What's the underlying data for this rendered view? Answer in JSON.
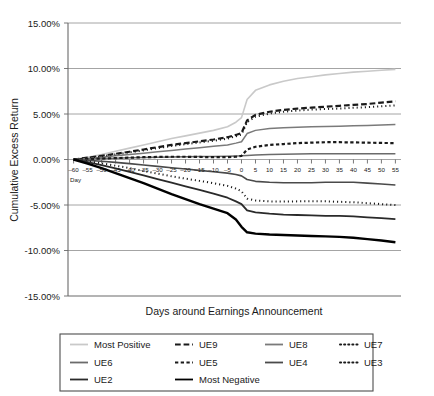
{
  "chart_data": {
    "type": "line",
    "title": "",
    "xlabel": "Days around Earnings Announcement",
    "ylabel": "Cumulative Excess Return",
    "xlim": [
      -62,
      57
    ],
    "ylim": [
      -15,
      15
    ],
    "grid": true,
    "legend_position": "bottom",
    "x_axis_prefix_label": "Day",
    "y_tick_labels": [
      "15.00%",
      "10.00%",
      "5.00%",
      "0.00%",
      "-5.00%",
      "-10.00%",
      "-15.00%"
    ],
    "y_tick_values": [
      15,
      10,
      5,
      0,
      -5,
      -10,
      -15
    ],
    "x_tick_labels": [
      "-60",
      "-55",
      "-50",
      "-45",
      "-40",
      "-35",
      "-30",
      "-25",
      "-20",
      "-15",
      "-10",
      "-5",
      "0",
      "5",
      "10",
      "15",
      "20",
      "25",
      "30",
      "35",
      "40",
      "45",
      "50",
      "55"
    ],
    "x": [
      -60,
      -55,
      -50,
      -45,
      -40,
      -35,
      -30,
      -25,
      -20,
      -15,
      -10,
      -5,
      -2,
      0,
      2,
      5,
      10,
      15,
      20,
      25,
      30,
      35,
      40,
      45,
      50,
      55
    ],
    "series": [
      {
        "name": "Most Positive",
        "style": "solid",
        "color": "#c9c9c9",
        "width": 1.6,
        "values": [
          0.0,
          0.25,
          0.55,
          0.9,
          1.25,
          1.6,
          1.95,
          2.3,
          2.6,
          2.9,
          3.2,
          3.6,
          4.1,
          4.6,
          6.6,
          7.6,
          8.2,
          8.6,
          8.9,
          9.1,
          9.3,
          9.45,
          9.6,
          9.7,
          9.8,
          9.9
        ]
      },
      {
        "name": "UE9",
        "style": "dashed",
        "color": "#1a1a1a",
        "width": 2.2,
        "values": [
          0.0,
          0.2,
          0.4,
          0.62,
          0.85,
          1.1,
          1.35,
          1.6,
          1.8,
          2.0,
          2.2,
          2.45,
          2.7,
          2.9,
          4.3,
          4.9,
          5.25,
          5.45,
          5.6,
          5.7,
          5.8,
          5.9,
          6.0,
          6.1,
          6.25,
          6.4
        ]
      },
      {
        "name": "UE8",
        "style": "solid",
        "color": "#7a7a7a",
        "width": 1.5,
        "values": [
          0.0,
          0.12,
          0.25,
          0.4,
          0.55,
          0.7,
          0.85,
          1.0,
          1.15,
          1.3,
          1.45,
          1.6,
          1.8,
          1.95,
          2.85,
          3.2,
          3.4,
          3.5,
          3.55,
          3.6,
          3.62,
          3.65,
          3.7,
          3.75,
          3.8,
          3.85
        ]
      },
      {
        "name": "UE7",
        "style": "dotted",
        "color": "#1a1a1a",
        "width": 2.0,
        "values": [
          0.0,
          0.18,
          0.36,
          0.56,
          0.78,
          1.0,
          1.25,
          1.48,
          1.68,
          1.88,
          2.05,
          2.3,
          2.55,
          2.75,
          4.1,
          4.7,
          5.05,
          5.25,
          5.38,
          5.48,
          5.55,
          5.6,
          5.68,
          5.75,
          5.85,
          5.95
        ]
      },
      {
        "name": "UE6",
        "style": "solid",
        "color": "#6b6b6b",
        "width": 1.5,
        "values": [
          0.0,
          0.05,
          0.1,
          0.14,
          0.18,
          0.22,
          0.25,
          0.28,
          0.3,
          0.32,
          0.34,
          0.36,
          0.38,
          0.4,
          0.45,
          0.5,
          0.55,
          0.58,
          0.6,
          0.62,
          0.62,
          0.62,
          0.62,
          0.62,
          0.62,
          0.62
        ]
      },
      {
        "name": "UE5",
        "style": "dashed-short",
        "color": "#1a1a1a",
        "width": 2.2,
        "values": [
          0.0,
          0.05,
          0.1,
          0.15,
          0.2,
          0.25,
          0.28,
          0.3,
          0.3,
          0.28,
          0.25,
          0.25,
          0.3,
          0.4,
          1.1,
          1.4,
          1.6,
          1.7,
          1.8,
          1.85,
          1.9,
          1.9,
          1.88,
          1.85,
          1.82,
          1.8
        ]
      },
      {
        "name": "UE4",
        "style": "solid",
        "color": "#4a4a4a",
        "width": 1.6,
        "values": [
          0.0,
          -0.1,
          -0.2,
          -0.32,
          -0.45,
          -0.6,
          -0.75,
          -0.9,
          -1.05,
          -1.2,
          -1.35,
          -1.5,
          -1.65,
          -1.8,
          -2.2,
          -2.4,
          -2.5,
          -2.55,
          -2.55,
          -2.55,
          -2.5,
          -2.5,
          -2.5,
          -2.6,
          -2.7,
          -2.8
        ]
      },
      {
        "name": "UE3",
        "style": "dotted",
        "color": "#1a1a1a",
        "width": 2.0,
        "values": [
          0.0,
          -0.2,
          -0.42,
          -0.68,
          -0.95,
          -1.25,
          -1.55,
          -1.85,
          -2.1,
          -2.35,
          -2.6,
          -2.9,
          -3.2,
          -3.5,
          -4.3,
          -4.5,
          -4.6,
          -4.62,
          -4.6,
          -4.58,
          -4.6,
          -4.65,
          -4.7,
          -4.8,
          -4.9,
          -5.0
        ]
      },
      {
        "name": "UE2",
        "style": "solid",
        "color": "#2a2a2a",
        "width": 1.8,
        "values": [
          0.0,
          -0.3,
          -0.62,
          -0.98,
          -1.35,
          -1.75,
          -2.15,
          -2.55,
          -2.95,
          -3.35,
          -3.75,
          -4.2,
          -4.6,
          -4.9,
          -5.6,
          -5.8,
          -5.95,
          -6.05,
          -6.1,
          -6.15,
          -6.2,
          -6.2,
          -6.25,
          -6.35,
          -6.45,
          -6.55
        ]
      },
      {
        "name": "Most Negative",
        "style": "solid",
        "color": "#000000",
        "width": 2.4,
        "values": [
          0.0,
          -0.45,
          -0.95,
          -1.5,
          -2.05,
          -2.6,
          -3.2,
          -3.8,
          -4.35,
          -4.9,
          -5.4,
          -5.9,
          -6.6,
          -7.4,
          -8.0,
          -8.15,
          -8.25,
          -8.3,
          -8.35,
          -8.4,
          -8.45,
          -8.5,
          -8.6,
          -8.75,
          -8.9,
          -9.1
        ]
      }
    ],
    "legend": [
      {
        "label": "Most Positive",
        "style": "solid",
        "color": "#c9c9c9"
      },
      {
        "label": "UE9",
        "style": "dashed",
        "color": "#1a1a1a"
      },
      {
        "label": "UE8",
        "style": "solid",
        "color": "#7a7a7a"
      },
      {
        "label": "UE7",
        "style": "dotted",
        "color": "#1a1a1a"
      },
      {
        "label": "UE6",
        "style": "solid",
        "color": "#6b6b6b"
      },
      {
        "label": "UE5",
        "style": "dashed-short",
        "color": "#1a1a1a"
      },
      {
        "label": "UE4",
        "style": "solid",
        "color": "#4a4a4a"
      },
      {
        "label": "UE3",
        "style": "dotted",
        "color": "#1a1a1a"
      },
      {
        "label": "UE2",
        "style": "solid",
        "color": "#2a2a2a"
      },
      {
        "label": "Most Negative",
        "style": "solid",
        "color": "#000000"
      }
    ]
  }
}
